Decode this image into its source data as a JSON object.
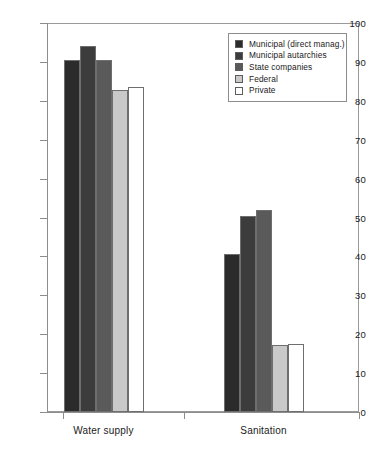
{
  "chart_data": {
    "type": "bar",
    "title": "",
    "subtitle": "",
    "xlabel": "",
    "ylabel": "",
    "categories": [
      "Water supply",
      "Sanitation"
    ],
    "series": [
      {
        "name": "Municipal (direct manag.)",
        "color": "#2b2b2b",
        "values": [
          90.5,
          40.5
        ]
      },
      {
        "name": "Municipal autarchies",
        "color": "#3c3c3c",
        "values": [
          94.0,
          50.3
        ]
      },
      {
        "name": "State companies",
        "color": "#5a5a5a",
        "values": [
          90.4,
          52.0
        ]
      },
      {
        "name": "Federal",
        "color": "#c9c9c9",
        "values": [
          82.7,
          17.3
        ]
      },
      {
        "name": "Private",
        "color": "#ffffff",
        "values": [
          83.5,
          17.5
        ]
      }
    ],
    "ylim": [
      0,
      100
    ],
    "ytick_labels": [
      "0",
      "10",
      "20",
      "30",
      "40",
      "50",
      "60",
      "70",
      "80",
      "90",
      "100"
    ],
    "ytick_values": [
      0,
      10,
      20,
      30,
      40,
      50,
      60,
      70,
      80,
      90,
      100
    ],
    "grid": false,
    "legend_position": "top-right",
    "bar_edge_color": "#6e6e6e",
    "axis_color": "#8d8d8d"
  },
  "legend": {
    "entries": [
      {
        "label": "Municipal (direct manag.)"
      },
      {
        "label": "Municipal autarchies"
      },
      {
        "label": "State companies"
      },
      {
        "label": "Federal"
      },
      {
        "label": "Private"
      }
    ]
  }
}
